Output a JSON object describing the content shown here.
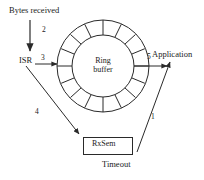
{
  "diagram": {
    "nodes": {
      "bytes_received": "Bytes received",
      "isr": "ISR",
      "ring_buffer_line1": "Ring",
      "ring_buffer_line2": "buffer",
      "application": "Application",
      "rxsem": "RxSem",
      "timeout": "Timeout"
    },
    "step_labels": {
      "step1": "1",
      "step2": "2",
      "step3": "3",
      "step4": "4",
      "step5": "5"
    },
    "ring": {
      "segments": 16,
      "center_x": 103,
      "center_y": 66,
      "outer_radius": 46,
      "inner_radius": 31
    },
    "colors": {
      "stroke": "#2a2a2a",
      "text": "#1a1a1a",
      "background": "#ffffff"
    }
  }
}
